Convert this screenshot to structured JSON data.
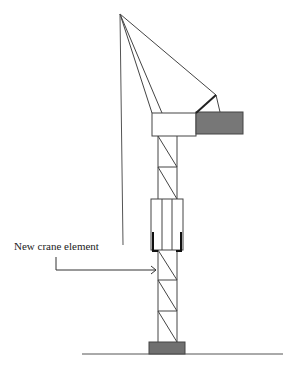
{
  "diagram": {
    "annotations": [
      {
        "id": "new-element",
        "text": "New crane element"
      }
    ],
    "colors": {
      "line": "#444444",
      "counterweight": "#777777",
      "base": "#707070",
      "bracket": "#111111",
      "background": "#ffffff"
    }
  }
}
